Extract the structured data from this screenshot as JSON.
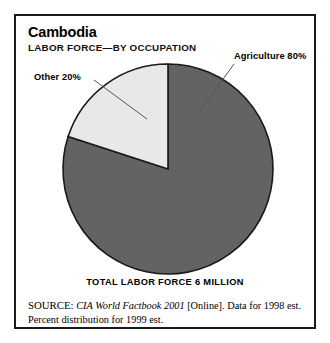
{
  "figure": {
    "title": "Cambodia",
    "subtitle": "LABOR FORCE—BY OCCUPATION",
    "caption": "TOTAL LABOR FORCE 6 MILLION",
    "source": {
      "label": "SOURCE:",
      "publication": "CIA World Factbook 2001",
      "rest_line1": " [Online]. Data for 1998 est.",
      "line2": "Percent distribution for 1999 est."
    },
    "border_color": "#1a1a1a"
  },
  "chart_data": {
    "type": "pie",
    "title": "Cambodia",
    "subtitle": "LABOR FORCE—BY OCCUPATION",
    "categories": [
      "Agriculture",
      "Other"
    ],
    "values": [
      80,
      20
    ],
    "unit": "percent",
    "labels": [
      "Agriculture 80%",
      "Other 20%"
    ],
    "colors": [
      "#636363",
      "#e8e8e8"
    ],
    "start_angle_deg": 0,
    "direction": "counterclockwise",
    "total_label": "TOTAL LABOR FORCE 6 MILLION",
    "total_value": 6,
    "total_unit": "million",
    "legend": "callout-labels",
    "grid": false,
    "xlabel": "",
    "ylabel": ""
  }
}
